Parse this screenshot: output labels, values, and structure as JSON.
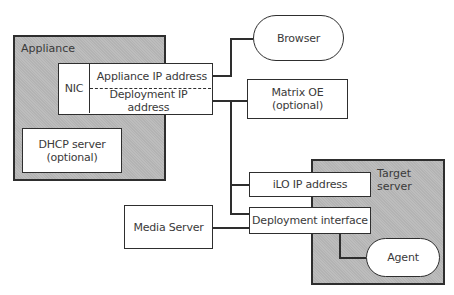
{
  "diagram": {
    "appliance": {
      "label": "Appliance",
      "nic": {
        "label": "NIC",
        "addresses": [
          "Appliance IP address",
          "Deployment IP address"
        ]
      },
      "dhcp": {
        "line1": "DHCP server",
        "line2": "(optional)"
      }
    },
    "browser": {
      "label": "Browser"
    },
    "matrix_oe": {
      "line1": "Matrix OE",
      "line2": "(optional)"
    },
    "target_server": {
      "label": "Target server",
      "ilo": {
        "label": "iLO IP address"
      },
      "deployment_interface": {
        "label": "Deployment interface"
      },
      "agent": {
        "label": "Agent"
      }
    },
    "media_server": {
      "label": "Media Server"
    }
  },
  "colors": {
    "container_fill": "#bdbdbd",
    "stroke": "#2e2e2e",
    "box_fill": "#ffffff",
    "text": "#3a3a3a"
  }
}
